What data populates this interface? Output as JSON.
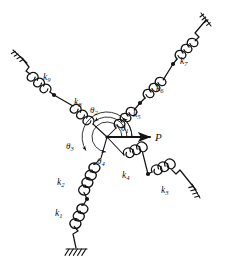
{
  "figure": {
    "background_color": "#ffffff",
    "ink_color": "#141414"
  },
  "hub": {
    "name": "central-node",
    "x": 107,
    "y": 137,
    "arc_radii": [
      10,
      15,
      20,
      25
    ]
  },
  "load": {
    "label": "P",
    "arrow_from": [
      107,
      137
    ],
    "arrow_to": [
      152,
      137
    ],
    "label_x": 156,
    "label_y": 141,
    "direction_deg": 0
  },
  "angles": [
    {
      "id": "theta1",
      "label": "θ",
      "subscript": "1",
      "x": 124,
      "y": 130,
      "arc_deg": 48,
      "radius": 25
    },
    {
      "id": "theta2",
      "label": "θ",
      "subscript": "2",
      "x": 94,
      "y": 112,
      "arc_deg": 128,
      "radius": 20
    },
    {
      "id": "theta3",
      "label": "θ",
      "subscript": "3",
      "x": 70,
      "y": 148,
      "arc_deg": 212,
      "radius": 25
    },
    {
      "id": "theta4",
      "label": "θ",
      "subscript": "4",
      "x": 101,
      "y": 163,
      "arc_deg": 276,
      "radius": 15
    }
  ],
  "springs": [
    {
      "id": "k1",
      "label": "k",
      "subscript": "1",
      "label_x": 60,
      "label_y": 215,
      "branch": "lower",
      "order": 2
    },
    {
      "id": "k2",
      "label": "k",
      "subscript": "2",
      "label_x": 62,
      "label_y": 184,
      "branch": "lower",
      "order": 1
    },
    {
      "id": "k3",
      "label": "k",
      "subscript": "3",
      "label_x": 165,
      "label_y": 192,
      "branch": "lower-right",
      "order": 2
    },
    {
      "id": "k4",
      "label": "k",
      "subscript": "4",
      "label_x": 127,
      "label_y": 177,
      "branch": "lower-right",
      "order": 1
    },
    {
      "id": "k5",
      "label": "k",
      "subscript": "5",
      "label_x": 137,
      "label_y": 116,
      "branch": "upper-right",
      "order": 1
    },
    {
      "id": "k6",
      "label": "k",
      "subscript": "6",
      "label_x": 160,
      "label_y": 90,
      "branch": "upper-right",
      "order": 2
    },
    {
      "id": "k7",
      "label": "k",
      "subscript": "7",
      "label_x": 184,
      "label_y": 63,
      "branch": "upper-right",
      "order": 3
    },
    {
      "id": "k8",
      "label": "k",
      "subscript": "8",
      "label_x": 78,
      "label_y": 104,
      "branch": "upper-left",
      "order": 1
    },
    {
      "id": "k9",
      "label": "k",
      "subscript": "9",
      "label_x": 47,
      "label_y": 79,
      "branch": "upper-left",
      "order": 2
    }
  ],
  "junction_dots": [
    {
      "id": "joint-upper-left",
      "x": 54,
      "y": 95
    },
    {
      "id": "joint-upper-right-inner",
      "x": 140,
      "y": 103
    },
    {
      "id": "joint-upper-right-outer",
      "x": 173,
      "y": 64
    },
    {
      "id": "joint-lower",
      "x": 87,
      "y": 199
    },
    {
      "id": "joint-lower-right",
      "x": 148,
      "y": 174
    }
  ],
  "grounds": [
    {
      "id": "ground-upper-left",
      "x": 22,
      "y": 58,
      "angle_deg": 225
    },
    {
      "id": "ground-upper-right",
      "x": 206,
      "y": 20,
      "angle_deg": 45
    },
    {
      "id": "ground-lower",
      "x": 76,
      "y": 248,
      "angle_deg": 270
    },
    {
      "id": "ground-lower-right",
      "x": 196,
      "y": 190,
      "angle_deg": 330
    }
  ],
  "branches": [
    {
      "id": "branch-upper-right",
      "direction_deg": 48,
      "springs": [
        "k5",
        "k6",
        "k7"
      ]
    },
    {
      "id": "branch-upper-left",
      "direction_deg": 128,
      "springs": [
        "k8",
        "k9"
      ]
    },
    {
      "id": "branch-lower",
      "direction_deg": 276,
      "springs": [
        "k2",
        "k1"
      ]
    },
    {
      "id": "branch-lower-right",
      "direction_deg": 330,
      "springs": [
        "k4",
        "k3"
      ]
    }
  ]
}
